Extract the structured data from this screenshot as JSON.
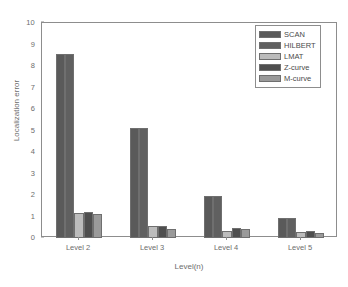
{
  "chart_data": {
    "type": "bar",
    "title": "",
    "xlabel": "Level(n)",
    "ylabel": "Localization error",
    "categories": [
      "Level 2",
      "Level 3",
      "Level 4",
      "Level 5"
    ],
    "ylim": [
      0,
      10
    ],
    "yticks": [
      0,
      1,
      2,
      3,
      4,
      5,
      6,
      7,
      8,
      9,
      10
    ],
    "ytick_labels": [
      "0",
      "1",
      "2",
      "3",
      "4",
      "5",
      "6",
      "7",
      "8",
      "9",
      "10"
    ],
    "grid": false,
    "legend_position": "top-right",
    "series": [
      {
        "name": "SCAN",
        "color": "#5a5a5a",
        "values": [
          8.55,
          5.13,
          1.97,
          0.93
        ]
      },
      {
        "name": "HILBERT",
        "color": "#606060",
        "values": [
          8.56,
          5.14,
          1.97,
          0.93
        ]
      },
      {
        "name": "LMAT",
        "color": "#bcbcbc",
        "values": [
          1.15,
          0.54,
          0.32,
          0.29
        ]
      },
      {
        "name": "Z-curve",
        "color": "#4e4e4e",
        "values": [
          1.22,
          0.55,
          0.47,
          0.33
        ]
      },
      {
        "name": "M-curve",
        "color": "#9a9a9a",
        "values": [
          1.13,
          0.43,
          0.42,
          0.23
        ]
      }
    ]
  },
  "legend": {
    "entries": [
      {
        "label": "SCAN"
      },
      {
        "label": "HILBERT"
      },
      {
        "label": "LMAT"
      },
      {
        "label": "Z-curve"
      },
      {
        "label": "M-curve"
      }
    ]
  },
  "axes": {
    "frame_color": "#8d8d8d",
    "text_color": "#6d6d6d"
  }
}
